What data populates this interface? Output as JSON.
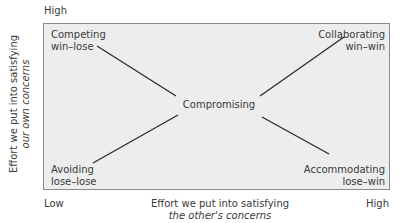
{
  "y_axis": {
    "high": "High",
    "label_line1": "Effort we put into satisfying",
    "label_line2": "our own concerns"
  },
  "x_axis": {
    "low": "Low",
    "high": "High",
    "label_line1": "Effort we put into satisfying",
    "label_line2": "the other's concerns"
  },
  "styles": {
    "competing": {
      "name": "Competing",
      "outcome": "win–lose"
    },
    "collaborating": {
      "name": "Collaborating",
      "outcome": "win–win"
    },
    "compromising": {
      "name": "Compromising"
    },
    "avoiding": {
      "name": "Avoiding",
      "outcome": "lose–lose"
    },
    "accommodating": {
      "name": "Accommodating",
      "outcome": "lose–win"
    }
  },
  "colors": {
    "box_fill": "#ededed",
    "box_border": "#8a8a8a",
    "line": "#2b2b2b",
    "text": "#3a3a3a"
  }
}
